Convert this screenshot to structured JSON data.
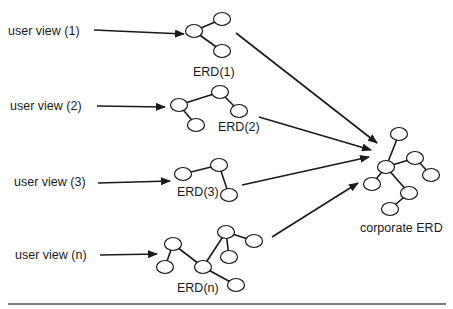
{
  "diagram": {
    "colors": {
      "stroke": "#1a1a1a",
      "background": "#ffffff",
      "rule": "#555555"
    },
    "user_views": [
      {
        "id": "uv1",
        "label": "user view (1)",
        "x": 8,
        "y": 35
      },
      {
        "id": "uv2",
        "label": "user view (2)",
        "x": 10,
        "y": 110
      },
      {
        "id": "uv3",
        "label": "user view (3)",
        "x": 14,
        "y": 186
      },
      {
        "id": "uvn",
        "label": "user view (n)",
        "x": 15,
        "y": 259
      }
    ],
    "erds": [
      {
        "id": "erd1",
        "label": "ERD(1)",
        "label_x": 193,
        "label_y": 76,
        "nodes": [
          [
            194,
            31
          ],
          [
            222,
            19
          ],
          [
            222,
            51
          ]
        ],
        "edges": [
          [
            0,
            1
          ],
          [
            0,
            2
          ]
        ]
      },
      {
        "id": "erd2",
        "label": "ERD(2)",
        "label_x": 218,
        "label_y": 131,
        "nodes": [
          [
            179,
            105
          ],
          [
            220,
            92
          ],
          [
            239,
            111
          ],
          [
            196,
            125
          ]
        ],
        "edges": [
          [
            0,
            1
          ],
          [
            1,
            2
          ],
          [
            0,
            3
          ]
        ]
      },
      {
        "id": "erd3",
        "label": "ERD(3)",
        "label_x": 177,
        "label_y": 196,
        "nodes": [
          [
            183,
            174
          ],
          [
            219,
            165
          ],
          [
            229,
            195
          ]
        ],
        "edges": [
          [
            0,
            1
          ],
          [
            1,
            2
          ]
        ]
      },
      {
        "id": "erdn",
        "label": "ERD(n)",
        "label_x": 177,
        "label_y": 292,
        "nodes": [
          [
            173,
            244
          ],
          [
            165,
            267
          ],
          [
            203,
            267
          ],
          [
            226,
            232
          ],
          [
            254,
            241
          ],
          [
            229,
            257
          ],
          [
            236,
            285
          ]
        ],
        "edges": [
          [
            0,
            1
          ],
          [
            0,
            2
          ],
          [
            2,
            3
          ],
          [
            3,
            4
          ],
          [
            3,
            5
          ],
          [
            2,
            6
          ]
        ]
      }
    ],
    "corporate_erd": {
      "label": "corporate ERD",
      "label_x": 360,
      "label_y": 232,
      "nodes": [
        [
          399,
          134
        ],
        [
          386,
          167
        ],
        [
          415,
          158
        ],
        [
          431,
          175
        ],
        [
          372,
          184
        ],
        [
          409,
          193
        ],
        [
          390,
          209
        ]
      ],
      "edges": [
        [
          0,
          1
        ],
        [
          1,
          2
        ],
        [
          2,
          3
        ],
        [
          1,
          4
        ],
        [
          1,
          5
        ],
        [
          5,
          6
        ]
      ]
    },
    "arrows_to_erd": [
      {
        "from": [
          94,
          30
        ],
        "to": [
          184,
          34
        ]
      },
      {
        "from": [
          97,
          106
        ],
        "to": [
          165,
          107
        ]
      },
      {
        "from": [
          98,
          183
        ],
        "to": [
          170,
          181
        ]
      },
      {
        "from": [
          100,
          255
        ],
        "to": [
          157,
          254
        ]
      }
    ],
    "arrows_to_corporate": [
      {
        "from": [
          236,
          33
        ],
        "to": [
          377,
          143
        ]
      },
      {
        "from": [
          259,
          117
        ],
        "to": [
          371,
          150
        ]
      },
      {
        "from": [
          242,
          185
        ],
        "to": [
          369,
          157
        ]
      },
      {
        "from": [
          272,
          237
        ],
        "to": [
          358,
          183
        ]
      }
    ],
    "bottom_rule": {
      "x1": 8,
      "x2": 446,
      "y": 304
    }
  }
}
